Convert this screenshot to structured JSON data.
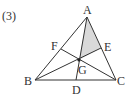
{
  "problem_label": "(3)",
  "points": {
    "A": {
      "label": "A",
      "x": 87,
      "y": 17
    },
    "B": {
      "label": "B",
      "x": 35,
      "y": 80
    },
    "C": {
      "label": "C",
      "x": 116,
      "y": 80
    },
    "D": {
      "label": "D",
      "x": 76,
      "y": 80
    },
    "E": {
      "label": "E",
      "x": 101,
      "y": 48
    },
    "F": {
      "label": "F",
      "x": 61,
      "y": 49
    },
    "G": {
      "label": "G",
      "x": 79,
      "y": 60
    }
  },
  "shaded_region": [
    "A",
    "G",
    "E"
  ],
  "colors": {
    "line": "#333333",
    "shade": "#d9d9d9"
  }
}
